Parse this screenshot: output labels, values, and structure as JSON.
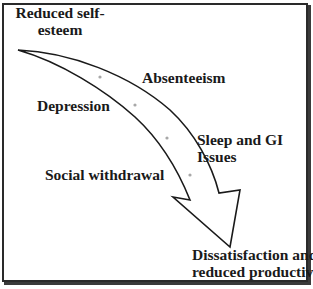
{
  "diagram": {
    "type": "curved-arrow-flow",
    "start_label": {
      "lines": [
        "Reduced self-",
        "esteem"
      ]
    },
    "stages": [
      {
        "label_lines": [
          "Absenteeism"
        ],
        "side": "right"
      },
      {
        "label_lines": [
          "Depression"
        ],
        "side": "left"
      },
      {
        "label_lines": [
          "Sleep and GI",
          "Issues"
        ],
        "side": "right"
      },
      {
        "label_lines": [
          "Social withdrawal"
        ],
        "side": "left"
      }
    ],
    "end_label": {
      "lines": [
        "Dissatisfaction and",
        "reduced productivity"
      ]
    },
    "colors": {
      "border": "#2a2a2a",
      "arrow_stroke": "#1a1a1a",
      "arrow_fill": "#ffffff",
      "dot": "#a8a8a8",
      "text": "#1a1a1a",
      "background": "#ffffff"
    },
    "marker_dots": 4
  }
}
